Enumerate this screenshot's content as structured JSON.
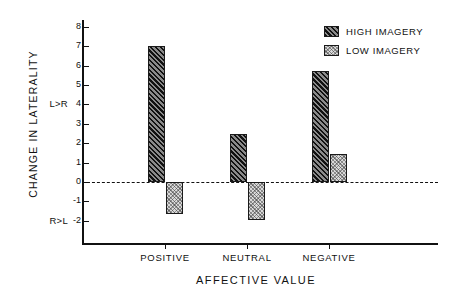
{
  "chart_data": {
    "type": "bar",
    "title": "",
    "xlabel": "AFFECTIVE  VALUE",
    "ylabel": "CHANGE  IN  LATERALITY",
    "categories": [
      "POSITIVE",
      "NEUTRAL",
      "NEGATIVE"
    ],
    "series": [
      {
        "name": "HIGH  IMAGERY",
        "values": [
          7.0,
          2.5,
          5.7
        ],
        "fill": "diagonal-hatch-dark"
      },
      {
        "name": "LOW  IMAGERY",
        "values": [
          -1.65,
          -1.95,
          1.45
        ],
        "fill": "stipple-light"
      }
    ],
    "ylim": [
      -2.6,
      8.6
    ],
    "yticks": [
      8,
      7,
      6,
      5,
      4,
      3,
      2,
      1,
      0,
      -1,
      -2
    ],
    "ytick_labels": [
      "8",
      "7",
      "6",
      "5",
      "4",
      "3",
      "2",
      "1",
      "0",
      "-1",
      "-2"
    ],
    "y_side_annotations": [
      {
        "value": 4,
        "text": "L>R"
      },
      {
        "value": -2,
        "text": "R>L"
      }
    ],
    "zero_line": {
      "value": 0,
      "style": "dashed"
    },
    "grid": false,
    "legend_position": "top-right",
    "accent_colors": {
      "axis": "#111111",
      "high_imagery": "#2b2b2b",
      "low_imagery": "#d9d9d9"
    }
  }
}
